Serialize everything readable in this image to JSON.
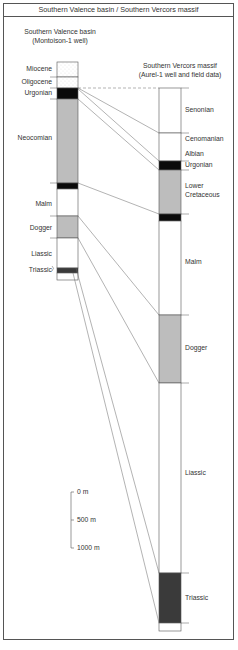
{
  "title": "Southern Valence basin / Southern Vercors massif",
  "left_column": {
    "title_line1": "Southern Valence basin",
    "title_line2": "(Montoison-1 well)",
    "units": [
      {
        "name": "Miocene",
        "fill": "dotted"
      },
      {
        "name": "Oligocene",
        "fill": "dotted"
      },
      {
        "name": "Urgonian",
        "fill": "black"
      },
      {
        "name": "Neocomian",
        "fill": "gray"
      },
      {
        "name": "Malm",
        "fill": "white"
      },
      {
        "name": "Dogger",
        "fill": "gray"
      },
      {
        "name": "Liassic",
        "fill": "white"
      },
      {
        "name": "Triassic",
        "fill": "darkgray"
      }
    ]
  },
  "right_column": {
    "title_line1": "Southern Vercors massif",
    "title_line2": "(Aurel-1 well and field data)",
    "units": [
      {
        "name": "Senonian",
        "fill": "white"
      },
      {
        "name": "Cenomanian",
        "fill": "white"
      },
      {
        "name": "Albian",
        "fill": "white"
      },
      {
        "name": "Urgonian",
        "fill": "black"
      },
      {
        "name": "Lower Cretaceous",
        "line1": "Lower",
        "line2": "Cretaceous",
        "fill": "gray"
      },
      {
        "name": "Malm",
        "fill": "white"
      },
      {
        "name": "Dogger",
        "fill": "gray"
      },
      {
        "name": "Liassic",
        "fill": "white"
      },
      {
        "name": "Triassic",
        "fill": "darkgray"
      }
    ]
  },
  "scale_bar": {
    "labels": [
      "0 m",
      "500 m",
      "1000 m"
    ]
  },
  "colors": {
    "gray": "#bdbdbd",
    "black": "#0a0a0a",
    "darkgray": "#3a3a3a",
    "line": "#555555"
  }
}
